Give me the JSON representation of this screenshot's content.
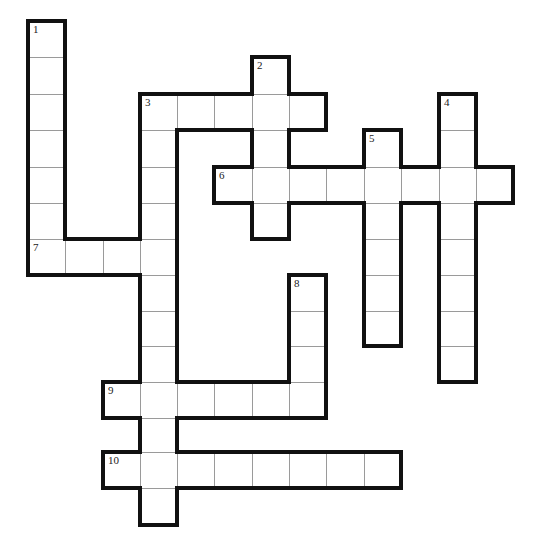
{
  "puzzle": {
    "type": "crossword",
    "colors": {
      "outline": "#111111",
      "inner_line": "#9a9a9a",
      "cell_bg": "#ffffff",
      "number": "#222222"
    },
    "grid_geometry": {
      "col_x": [
        28,
        65,
        103,
        140,
        177,
        214,
        252,
        289,
        326,
        364,
        401,
        439,
        476,
        513
      ],
      "row_y": [
        21,
        57,
        94,
        130,
        167,
        203,
        239,
        275,
        311,
        346,
        382,
        418,
        452,
        488,
        525
      ]
    },
    "entries": [
      {
        "number": "1",
        "direction": "down",
        "col": 0,
        "row": 0,
        "length": 7
      },
      {
        "number": "2",
        "direction": "down",
        "col": 6,
        "row": 1,
        "length": 5
      },
      {
        "number": "3",
        "direction": "across",
        "col": 3,
        "row": 2,
        "length": 5
      },
      {
        "number": "3",
        "direction": "down",
        "col": 3,
        "row": 2,
        "length": 12
      },
      {
        "number": "4",
        "direction": "down",
        "col": 11,
        "row": 2,
        "length": 8
      },
      {
        "number": "5",
        "direction": "down",
        "col": 9,
        "row": 3,
        "length": 6
      },
      {
        "number": "6",
        "direction": "across",
        "col": 5,
        "row": 4,
        "length": 8
      },
      {
        "number": "7",
        "direction": "across",
        "col": 0,
        "row": 6,
        "length": 4
      },
      {
        "number": "8",
        "direction": "down",
        "col": 7,
        "row": 7,
        "length": 4
      },
      {
        "number": "9",
        "direction": "across",
        "col": 2,
        "row": 10,
        "length": 6
      },
      {
        "number": "10",
        "direction": "across",
        "col": 2,
        "row": 12,
        "length": 8
      }
    ]
  }
}
